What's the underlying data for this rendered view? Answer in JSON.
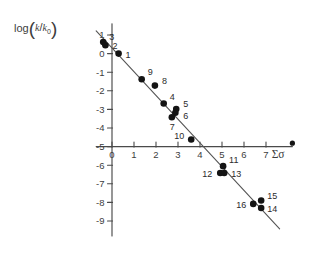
{
  "figure": {
    "width": 312,
    "height": 272,
    "background": "#ffffff",
    "ink_color": "#141414",
    "axis_color": "#4a4a4a"
  },
  "labels": {
    "ylabel_prefix": "log",
    "ylabel_numerator": "k",
    "ylabel_denominator": "k",
    "ylabel_denominator_sub": "0",
    "xlabel": "Σσ"
  },
  "chart_data": {
    "type": "scatter",
    "title": "",
    "subtitle": "",
    "xlabel": "Σσ",
    "ylabel": "log (k/k₀)",
    "xlim": [
      -0.9,
      8.2
    ],
    "ylim": [
      -9.8,
      1.6
    ],
    "xticks": [
      0,
      1,
      2,
      3,
      4,
      5,
      6,
      7
    ],
    "xtick_labels": [
      "0",
      "1",
      "2",
      "3",
      "4",
      "5",
      "6",
      "7"
    ],
    "yticks": [
      1,
      0,
      -1,
      -2,
      -3,
      -4,
      -5,
      -6,
      -7,
      -8,
      -9
    ],
    "ytick_labels": [
      "1",
      "0",
      "-1",
      "-2",
      "-3",
      "-4",
      "-5",
      "-6",
      "-7",
      "-8",
      "-9"
    ],
    "grid": false,
    "legend": false,
    "x_axis_crosses_y_at": -5,
    "y_axis_crosses_x_at": 0,
    "marker": "filled-circle",
    "points": [
      {
        "label": "1",
        "x": 0.3,
        "y": 0.0,
        "label_dx": 7,
        "label_dy": 4
      },
      {
        "label": "2",
        "x": -0.3,
        "y": 0.45,
        "label_dx": 7,
        "label_dy": 4
      },
      {
        "label": "3",
        "x": -0.4,
        "y": 0.62,
        "label_dx": 6,
        "label_dy": -2
      },
      {
        "label": "4",
        "x": 2.35,
        "y": -2.68,
        "label_dx": 6,
        "label_dy": -3
      },
      {
        "label": "5",
        "x": 2.92,
        "y": -2.98,
        "label_dx": 7,
        "label_dy": -2
      },
      {
        "label": "6",
        "x": 2.88,
        "y": -3.18,
        "label_dx": 8,
        "label_dy": 6
      },
      {
        "label": "7",
        "x": 2.72,
        "y": -3.42,
        "label_dx": -2,
        "label_dy": 13
      },
      {
        "label": "8",
        "x": 1.95,
        "y": -1.72,
        "label_dx": 7,
        "label_dy": -2
      },
      {
        "label": "9",
        "x": 1.35,
        "y": -1.38,
        "label_dx": 6,
        "label_dy": -4
      },
      {
        "label": "10",
        "x": 3.6,
        "y": -4.62,
        "label_dx": -17,
        "label_dy": -1
      },
      {
        "label": "11",
        "x": 5.05,
        "y": -6.05,
        "label_dx": 6,
        "label_dy": -3
      },
      {
        "label": "12",
        "x": 4.92,
        "y": -6.42,
        "label_dx": -18,
        "label_dy": 4
      },
      {
        "label": "13",
        "x": 5.1,
        "y": -6.42,
        "label_dx": 7,
        "label_dy": 4
      },
      {
        "label": "14",
        "x": 6.78,
        "y": -8.3,
        "label_dx": 6,
        "label_dy": 4
      },
      {
        "label": "15",
        "x": 6.78,
        "y": -7.9,
        "label_dx": 6,
        "label_dy": -2
      },
      {
        "label": "16",
        "x": 6.42,
        "y": -8.08,
        "label_dx": -17,
        "label_dy": 4
      }
    ],
    "fit_line": {
      "type": "linear",
      "x_start": -0.72,
      "y_start": 1.22,
      "x_end": 7.62,
      "y_end": -9.42,
      "slope": -1.276,
      "intercept": 0.301
    }
  }
}
